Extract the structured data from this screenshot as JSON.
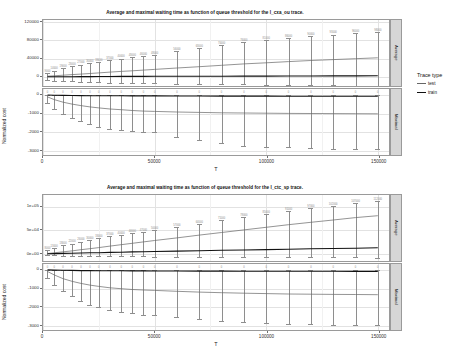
{
  "figures": [
    {
      "id": "fig-ctx-ou",
      "title": "Average and maximal waiting time as function of queue threshold for the l_cxa_ou trace.",
      "xlabel": "T",
      "ylabel": "Normalized cost",
      "facets": [
        "Average",
        "Maximal"
      ],
      "xticks": [
        "0",
        "50000",
        "100000",
        "150000"
      ],
      "yticks_top": [
        "120000",
        "80000",
        "40000",
        "0"
      ],
      "yticks_bottom": [
        "0",
        "-1000",
        "-2000",
        "-3000"
      ]
    },
    {
      "id": "fig-ctc-sp",
      "title": "Average and maximal waiting time as function of queue threshold for the l_ctc_sp trace.",
      "xlabel": "T",
      "ylabel": "Normalized cost",
      "facets": [
        "Average",
        "Maximal"
      ],
      "xticks": [
        "0",
        "50000",
        "100000",
        "150000"
      ],
      "yticks_top": [
        "1e+05",
        "5e+04",
        "0e+00"
      ],
      "yticks_bottom": [
        "0",
        "-1000",
        "-2000",
        "-3000"
      ]
    }
  ],
  "legend": {
    "title": "Trace type",
    "items": [
      {
        "label": "test",
        "color": "#666666"
      },
      {
        "label": "train",
        "color": "#111111"
      }
    ]
  },
  "chart_data": [
    {
      "type": "line",
      "id": "l_cxa_ou-average",
      "title": "Average and maximal waiting time as function of queue threshold for the l_cxa_ou trace.",
      "facet": "Average",
      "xlabel": "T",
      "ylabel": "Normalized cost",
      "xlim": [
        0,
        155000
      ],
      "ylim": [
        -20000,
        125000
      ],
      "grid": true,
      "legend_position": "right",
      "x": [
        2000,
        5000,
        9000,
        13000,
        17000,
        21000,
        25000,
        30000,
        35000,
        40000,
        45000,
        50000,
        60000,
        70000,
        80000,
        90000,
        100000,
        110000,
        120000,
        130000,
        140000,
        150000
      ],
      "series": [
        {
          "name": "test",
          "values": [
            1500,
            2500,
            3800,
            5000,
            6200,
            7500,
            8800,
            10500,
            12000,
            13500,
            15000,
            16500,
            19500,
            22500,
            25500,
            28500,
            31000,
            33500,
            36000,
            38000,
            40000,
            42000
          ],
          "err_upper": [
            9000,
            14000,
            19000,
            23000,
            27000,
            30000,
            33000,
            37000,
            40000,
            43000,
            46000,
            48000,
            56000,
            63000,
            70000,
            76000,
            81000,
            86000,
            90000,
            93000,
            96000,
            98000
          ],
          "err_lower": [
            -6000,
            -8000,
            -9000,
            -10000,
            -11000,
            -11500,
            -12000,
            -12500,
            -13000,
            -13500,
            -14000,
            -14500,
            -15000,
            -15500,
            -16000,
            -16500,
            -17000,
            -17500,
            -18000,
            -18500,
            -19000,
            -19500
          ]
        },
        {
          "name": "train",
          "values": [
            200,
            300,
            400,
            500,
            600,
            700,
            800,
            900,
            1000,
            1100,
            1200,
            1300,
            1400,
            1500,
            1600,
            1700,
            1800,
            1900,
            2000,
            2100,
            2200,
            2300
          ]
        }
      ]
    },
    {
      "type": "line",
      "id": "l_cxa_ou-maximal",
      "facet": "Maximal",
      "xlabel": "T",
      "ylabel": "Normalized cost",
      "xlim": [
        0,
        155000
      ],
      "ylim": [
        -3200,
        300
      ],
      "grid": true,
      "x": [
        2000,
        5000,
        9000,
        13000,
        17000,
        21000,
        25000,
        30000,
        35000,
        40000,
        45000,
        50000,
        60000,
        70000,
        80000,
        90000,
        100000,
        110000,
        120000,
        130000,
        140000,
        150000
      ],
      "series": [
        {
          "name": "test",
          "values": [
            -120,
            -260,
            -400,
            -500,
            -580,
            -650,
            -700,
            -760,
            -800,
            -840,
            -870,
            -890,
            -920,
            -940,
            -960,
            -975,
            -985,
            -995,
            -1000,
            -1005,
            -1010,
            -1015
          ],
          "err_upper": [
            0,
            0,
            0,
            0,
            0,
            0,
            0,
            0,
            0,
            0,
            0,
            0,
            0,
            0,
            0,
            0,
            0,
            0,
            0,
            0,
            0,
            0
          ],
          "err_lower": [
            -450,
            -760,
            -1050,
            -1250,
            -1400,
            -1550,
            -1700,
            -1800,
            -1870,
            -1930,
            -1960,
            -1980,
            -2250,
            -2420,
            -2580,
            -2700,
            -2760,
            -2800,
            -2830,
            -2860,
            -2880,
            -2900
          ]
        },
        {
          "name": "train",
          "values": [
            -20,
            -30,
            -40,
            -45,
            -50,
            -55,
            -58,
            -60,
            -62,
            -64,
            -66,
            -68,
            -70,
            -72,
            -74,
            -76,
            -78,
            -80,
            -82,
            -84,
            -86,
            -88
          ]
        }
      ]
    },
    {
      "type": "line",
      "id": "l_ctc_sp-average",
      "title": "Average and maximal waiting time as function of queue threshold for the l_ctc_sp trace.",
      "facet": "Average",
      "xlabel": "T",
      "ylabel": "Normalized cost",
      "xlim": [
        0,
        155000
      ],
      "ylim": [
        -15000,
        125000
      ],
      "grid": true,
      "x": [
        2000,
        5000,
        9000,
        13000,
        17000,
        21000,
        25000,
        30000,
        35000,
        40000,
        45000,
        50000,
        60000,
        70000,
        80000,
        90000,
        100000,
        110000,
        120000,
        130000,
        140000,
        150000
      ],
      "series": [
        {
          "name": "test",
          "values": [
            1000,
            2500,
            4500,
            6500,
            9000,
            11000,
            13500,
            16500,
            19500,
            22500,
            25500,
            28500,
            34000,
            40000,
            45500,
            51000,
            56500,
            62000,
            67000,
            72000,
            77000,
            81000
          ],
          "err_upper": [
            8000,
            13000,
            18000,
            22000,
            26000,
            30000,
            33000,
            37000,
            40000,
            44000,
            47000,
            50000,
            57000,
            64000,
            71000,
            78000,
            85000,
            91000,
            97000,
            102000,
            107000,
            112000
          ],
          "err_lower": [
            -2000,
            -3000,
            -3500,
            -4000,
            -4200,
            -4400,
            -4600,
            -4800,
            -5000,
            -5200,
            -5400,
            -5600,
            -5800,
            -6000,
            -6200,
            -6400,
            -6600,
            -6800,
            -7000,
            -7200,
            -7400,
            -7600
          ]
        },
        {
          "name": "train",
          "values": [
            400,
            700,
            1100,
            1500,
            1900,
            2300,
            2700,
            3200,
            3700,
            4200,
            4700,
            5200,
            6000,
            6800,
            7600,
            8400,
            9200,
            10000,
            10800,
            11500,
            12200,
            12900
          ]
        }
      ]
    },
    {
      "type": "line",
      "id": "l_ctc_sp-maximal",
      "facet": "Maximal",
      "xlabel": "T",
      "ylabel": "Normalized cost",
      "xlim": [
        0,
        155000
      ],
      "ylim": [
        -3200,
        300
      ],
      "grid": true,
      "x": [
        2000,
        5000,
        9000,
        13000,
        17000,
        21000,
        25000,
        30000,
        35000,
        40000,
        45000,
        50000,
        60000,
        70000,
        80000,
        90000,
        100000,
        110000,
        120000,
        130000,
        140000,
        150000
      ],
      "series": [
        {
          "name": "test",
          "values": [
            -100,
            -280,
            -480,
            -620,
            -730,
            -820,
            -890,
            -960,
            -1010,
            -1050,
            -1080,
            -1100,
            -1150,
            -1190,
            -1220,
            -1250,
            -1270,
            -1290,
            -1300,
            -1310,
            -1320,
            -1330
          ],
          "err_upper": [
            0,
            0,
            0,
            0,
            0,
            0,
            0,
            0,
            0,
            0,
            0,
            0,
            0,
            0,
            0,
            0,
            0,
            0,
            0,
            0,
            0,
            0
          ],
          "err_lower": [
            -420,
            -800,
            -1150,
            -1420,
            -1650,
            -1850,
            -2000,
            -2150,
            -2250,
            -2320,
            -2380,
            -2430,
            -2520,
            -2620,
            -2700,
            -2760,
            -2820,
            -2860,
            -2890,
            -2910,
            -2930,
            -2950
          ]
        },
        {
          "name": "train",
          "values": [
            -15,
            -25,
            -35,
            -42,
            -48,
            -52,
            -56,
            -60,
            -63,
            -66,
            -68,
            -70,
            -73,
            -76,
            -78,
            -80,
            -82,
            -84,
            -86,
            -88,
            -90,
            -92
          ]
        }
      ]
    }
  ]
}
